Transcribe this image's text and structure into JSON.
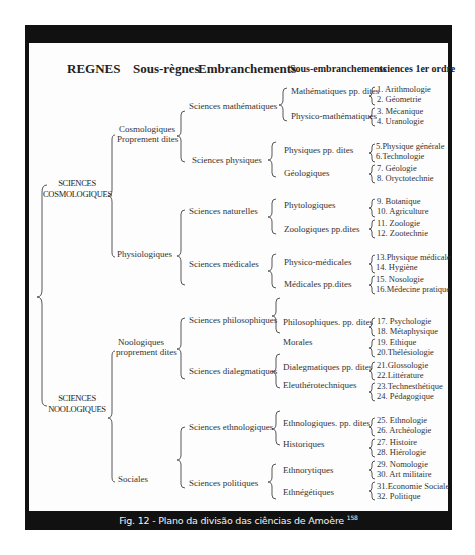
{
  "headers": {
    "regnes": "REGNES",
    "sous_regnes": "Sous-règnes",
    "embranchements": "Embranchements",
    "sous_embranchements": "Sous-embranchements",
    "sciences_1er_ordre": "sciences 1er ordre"
  },
  "regnes": [
    {
      "line1": "SCIENCES",
      "line2": "COSMOLOGIQUES"
    },
    {
      "line1": "SCIENCES",
      "line2": "NOOLOGIQUES"
    }
  ],
  "sous_regnes": [
    {
      "line1": "Cosmologiques",
      "line2": "Proprement dites"
    },
    {
      "line1": "Physiologiques"
    },
    {
      "line1": "Noologiques",
      "line2": "proprement dites"
    },
    {
      "line1": "Sociales"
    }
  ],
  "embranchements": [
    "Sciences mathématiques",
    "Sciences physiques",
    "Sciences naturelles",
    "Sciences médicales",
    "Sciences philosophiques",
    "Sciences dialegmatiques",
    "Sciences ethnologiques",
    "Sciences politiques"
  ],
  "sous_embranchements": [
    "Mathématiques pp. dites",
    "Physico-mathématiques",
    "Physiques pp. dites",
    "Géologiques",
    "Phytologiques",
    "Zoologiques pp.dites",
    "Physico-médicales",
    "Médicales pp.dites",
    "Philosophiques. pp. dites",
    "Morales",
    "Dialegmatiques pp. dites",
    "Eleuthérotechniques",
    "Ethnologiques. pp. dites",
    "Historiques",
    "Ethnorytiques",
    "Ethnégétiques"
  ],
  "sciences": [
    "1. Arithmologie",
    "2. Géometrie",
    "3. Mécanique",
    "4. Uranologie",
    "5.Physique générale",
    "6.Technologie",
    "7. Géologie",
    "8. Oryctotechnie",
    "9. Botanique",
    "10. Agriculture",
    "11. Zoologie",
    "12. Zootechnie",
    "13.Physique médicale",
    "14. Hygiène",
    "15. Nosologie",
    "16.Médecine pratique",
    "17. Psychologie",
    "18. Métaphysique",
    "19. Ethique",
    "20.Thélésiologie",
    "21.Glossologie",
    "22.Littérature",
    "23.Technesthétique",
    "24. Pédagogique",
    "25. Ethnologie",
    "26. Archéologie",
    "27. Histoire",
    "28. Hiérologie",
    "29. Nomologie",
    "30. Art militaire",
    "31.Economie Sociale",
    "32. Politique"
  ],
  "caption": {
    "text": "Fig. 12 - Plano da divisão das ciências de Amoère",
    "footnote": "158"
  },
  "colors": {
    "frame": "#111111",
    "background": "#fdfdfd",
    "caption_text": "#f2f2f2"
  }
}
